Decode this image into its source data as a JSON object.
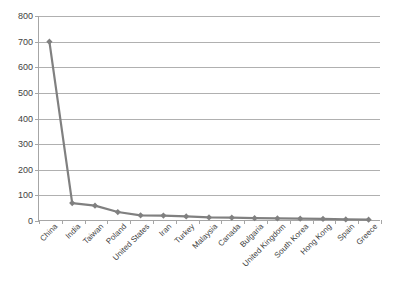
{
  "chart_data": {
    "type": "line",
    "title": "",
    "subtitle": "",
    "xlabel": "",
    "ylabel": "",
    "ylim": [
      0,
      800
    ],
    "ytick_step": 100,
    "yticks": [
      800,
      700,
      600,
      500,
      400,
      300,
      200,
      100,
      0
    ],
    "grid": true,
    "legend": false,
    "legend_position": "none",
    "marker": "diamond",
    "series_color": "#808080",
    "gridline_color": "#b0b0b0",
    "axis_color": "#a6a6a6",
    "background_color": "#ffffff",
    "categories": [
      "China",
      "India",
      "Taiwan",
      "Poland",
      "United States",
      "Iran",
      "Turkey",
      "Malaysia",
      "Canada",
      "Bulgaria",
      "United Kingdom",
      "South Korea",
      "Hong Kong",
      "Spain",
      "Greece"
    ],
    "values": [
      700,
      70,
      60,
      35,
      22,
      21,
      18,
      14,
      13,
      11,
      10,
      9,
      8,
      6,
      5
    ],
    "series": [
      {
        "name": "Series 1",
        "values": [
          700,
          70,
          60,
          35,
          22,
          21,
          18,
          14,
          13,
          11,
          10,
          9,
          8,
          6,
          5
        ]
      }
    ]
  }
}
